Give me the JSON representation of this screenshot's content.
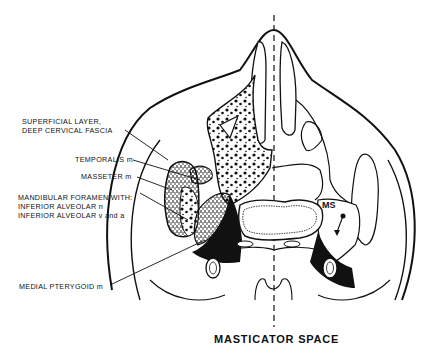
{
  "diagram": {
    "title": "MASTICATOR SPACE",
    "labels": {
      "superficial_layer_1": "SUPERFICIAL LAYER,",
      "superficial_layer_2": "DEEP CERVICAL FASCIA",
      "temporalis": "TEMPORALIS m",
      "masseter": "MASSETER m",
      "mandibular_1": "MANDIBULAR FORAMEN WITH:",
      "mandibular_2": "INFERIOR ALVEOLAR n",
      "mandibular_3": "INFERIOR ALVEOLAR v and a",
      "medial_pterygoid": "MEDIAL PTERYGOID m",
      "ms": "MS"
    },
    "colors": {
      "ink": "#111111",
      "background": "#ffffff"
    }
  }
}
